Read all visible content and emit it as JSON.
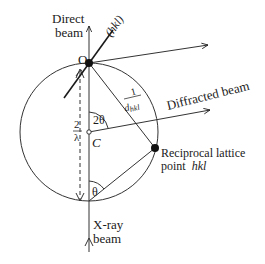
{
  "diagram": {
    "labels": {
      "direct_beam_line1": "Direct",
      "direct_beam_line2": "beam",
      "plane": "(hkl)",
      "origin": "O",
      "inv_d_num": "1",
      "inv_d_den": "d",
      "inv_d_sub": "hkl",
      "diffracted_beam": "Diffracted beam",
      "two_theta": "2θ",
      "two_over_lambda_num": "2",
      "two_over_lambda_den": "λ",
      "center": "C",
      "recip_line1": "Reciprocal lattice",
      "recip_line2": "point",
      "recip_hkl": "hkl",
      "theta": "θ",
      "xray_line1": "X-ray",
      "xray_line2": "beam"
    },
    "colors": {
      "ink": "#1a1a1a",
      "background": "#ffffff"
    }
  }
}
